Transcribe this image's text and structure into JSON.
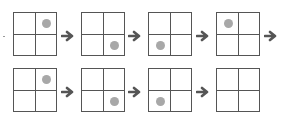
{
  "colors": {
    "grid_line": "#555555",
    "dot": "#a8a8a8",
    "arrow": "#555555"
  },
  "rows": [
    {
      "grids": [
        {
          "dot": "top-right"
        },
        {
          "dot": "bottom-right"
        },
        {
          "dot": "bottom-left"
        },
        {
          "dot": "top-left"
        }
      ],
      "trailing_arrow": true
    },
    {
      "grids": [
        {
          "dot": "top-right"
        },
        {
          "dot": "bottom-right"
        },
        {
          "dot": "bottom-left"
        },
        {
          "dot": "none"
        }
      ],
      "trailing_arrow": false
    }
  ]
}
